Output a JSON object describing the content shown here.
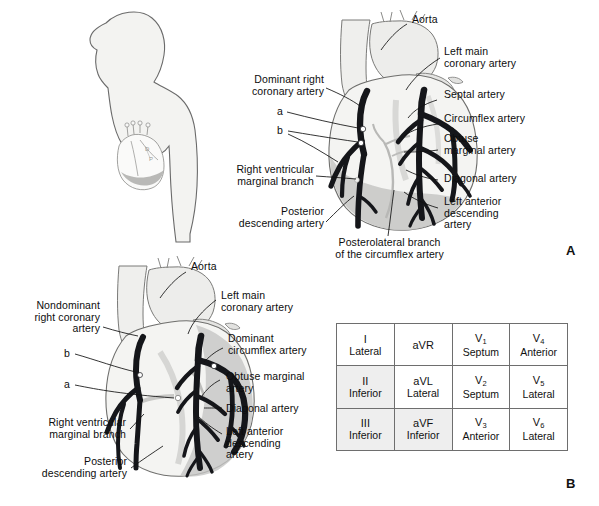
{
  "figure": {
    "panels": [
      {
        "letter": "A",
        "caption": "Dominant right coronary artery circulation"
      },
      {
        "letter": "B",
        "caption": "Nondominant right coronary artery circulation with dominant circumflex"
      }
    ]
  },
  "panel_a": {
    "letter": "A",
    "labels": {
      "aorta": "Aorta",
      "left_main": "Left main\ncoronary artery",
      "septal": "Septal artery",
      "circumflex": "Circumflex artery",
      "obtuse_marginal": "Obtuse\nmarginal artery",
      "diagonal": "Diagonal artery",
      "lad": "Left anterior\ndescending\nartery",
      "dominant_rca": "Dominant right\ncoronary artery",
      "marker_a": "a",
      "marker_b": "b",
      "rv_marginal": "Right ventricular\nmarginal branch",
      "pda": "Posterior\ndescending artery",
      "posterolateral": "Posterolateral branch\nof the circumflex artery"
    }
  },
  "panel_b": {
    "letter": "B",
    "labels": {
      "aorta": "Aorta",
      "left_main": "Left main\ncoronary artery",
      "nondominant_rca": "Nondominant\nright coronary\nartery",
      "dominant_circumflex": "Dominant\ncircumflex artery",
      "obtuse_marginal": "Obtuse marginal\nartery",
      "diagonal": "Diagonal artery",
      "lad": "Left anterior\ndescending\nartery",
      "marker_b": "b",
      "marker_a": "a",
      "rv_marginal": "Right ventricular\nmarginal branch",
      "pda": "Posterior\ndescending artery"
    }
  },
  "ecg_table": {
    "rows": [
      [
        {
          "lead": "I",
          "region": "Lateral",
          "shaded": false
        },
        {
          "lead": "aVR",
          "region": "",
          "shaded": false
        },
        {
          "lead": "V",
          "sub": "1",
          "region": "Septum",
          "shaded": false
        },
        {
          "lead": "V",
          "sub": "4",
          "region": "Anterior",
          "shaded": false
        }
      ],
      [
        {
          "lead": "II",
          "region": "Inferior",
          "shaded": true
        },
        {
          "lead": "aVL",
          "region": "Lateral",
          "shaded": false
        },
        {
          "lead": "V",
          "sub": "2",
          "region": "Septum",
          "shaded": false
        },
        {
          "lead": "V",
          "sub": "5",
          "region": "Lateral",
          "shaded": false
        }
      ],
      [
        {
          "lead": "III",
          "region": "Inferior",
          "shaded": true
        },
        {
          "lead": "aVF",
          "region": "Inferior",
          "shaded": true
        },
        {
          "lead": "V",
          "sub": "3",
          "region": "Anterior",
          "shaded": false
        },
        {
          "lead": "V",
          "sub": "6",
          "region": "Lateral",
          "shaded": false
        }
      ]
    ]
  },
  "body_silhouette": {
    "description": "Lateral profile of a human torso and head showing heart position in chest"
  },
  "colors": {
    "artery": "#15161a",
    "heart_fill": "#f2f2f0",
    "heart_shade": "#c9c9c7",
    "body_fill": "#f3f3f1",
    "outline": "#6a6a6a",
    "text": "#0d0d0d",
    "table_border": "#3a3a3a",
    "table_shade": "#eeeeee"
  }
}
